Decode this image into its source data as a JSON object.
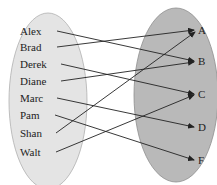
{
  "diagram": {
    "type": "mapping",
    "domain_set": {
      "fill": "#e4e4e4",
      "stroke": "#b0b0b0",
      "elements": [
        "Alex",
        "Brad",
        "Derek",
        "Diane",
        "Marc",
        "Pam",
        "Shan",
        "Walt"
      ]
    },
    "codomain_set": {
      "fill": "#b9b9b9",
      "stroke": "#8e8e8e",
      "elements": [
        "A",
        "B",
        "C",
        "D",
        "F"
      ]
    },
    "mappings": [
      {
        "from": "Alex",
        "to": "B"
      },
      {
        "from": "Brad",
        "to": "A"
      },
      {
        "from": "Derek",
        "to": "C"
      },
      {
        "from": "Diane",
        "to": "B"
      },
      {
        "from": "Marc",
        "to": "D"
      },
      {
        "from": "Pam",
        "to": "F"
      },
      {
        "from": "Shan",
        "to": "A"
      },
      {
        "from": "Walt",
        "to": "C"
      }
    ],
    "arrow_color": "#222222"
  }
}
